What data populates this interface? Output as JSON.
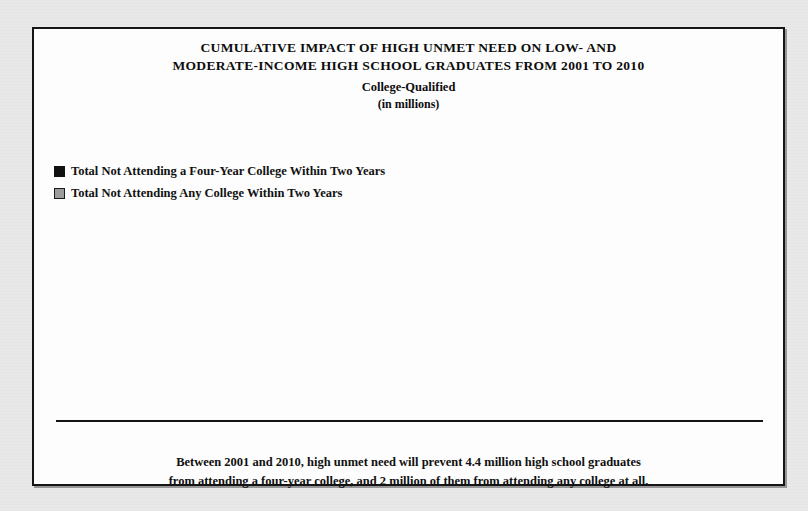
{
  "chart_data": {
    "type": "bar",
    "title": "CUMULATIVE  IMPACT OF HIGH UNMET NEED ON LOW- AND MODERATE-INCOME HIGH SCHOOL GRADUATES FROM 2001 TO 2010",
    "title_line1": "CUMULATIVE  IMPACT OF HIGH UNMET NEED ON LOW- AND",
    "title_line2": "MODERATE-INCOME HIGH SCHOOL GRADUATES FROM 2001 TO 2010",
    "subtitle": "College-Qualified",
    "units": "(in millions)",
    "xlabel": "",
    "ylabel": "",
    "ylim": [
      0,
      4.4
    ],
    "grid": false,
    "legend_position": "top-left",
    "categories": [
      "2001",
      "2002",
      "2003",
      "2004",
      "2005",
      "2006",
      "2007",
      "2008",
      "2009",
      "2010"
    ],
    "series": [
      {
        "name": "Total Not Attending a Four-Year College Within Two Years",
        "color": "#121212",
        "values": [
          0.4,
          0.8,
          1.2,
          1.7,
          2.1,
          2.6,
          3.0,
          3.5,
          3.9,
          4.4
        ],
        "labels": [
          "0.4",
          "0.8",
          "1.2",
          "1.7",
          "2.1",
          "2.6",
          "3.0",
          "3.5",
          "3.9",
          "4.4"
        ]
      },
      {
        "name": "Total Not Attending Any College Within Two Years",
        "color": "#9e9e9e",
        "values": [
          0.2,
          0.4,
          0.6,
          0.8,
          1.0,
          1.2,
          1.4,
          1.6,
          1.8,
          2.0
        ],
        "labels": [
          "0.2",
          "0.4",
          "0.6",
          "0.8",
          "1.0",
          "1.2",
          "1.4",
          "1.6",
          "1.8",
          "2.0"
        ]
      }
    ],
    "annotation_line1": "Between 2001 and 2010, high unmet need will prevent 4.4 million high school graduates",
    "annotation_line2": "from attending a four-year college, and 2 million of them from attending any college at all."
  },
  "legend": {
    "items": [
      {
        "label": "Total Not Attending a Four-Year College Within Two Years",
        "swatch": "black-square-icon"
      },
      {
        "label": "Total Not Attending Any College Within Two Years",
        "swatch": "gray-square-icon"
      }
    ]
  }
}
